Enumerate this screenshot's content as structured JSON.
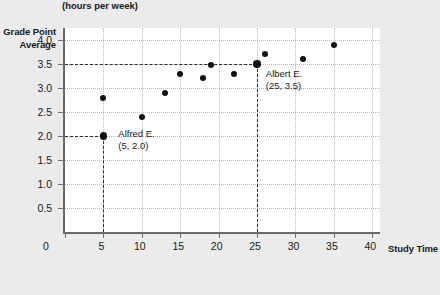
{
  "chart_data": {
    "type": "scatter",
    "title": "",
    "xlabel": "Study Time",
    "xlabel_unit": "(hours per week)",
    "ylabel": "Grade Point Average",
    "xlim": [
      0,
      41
    ],
    "ylim": [
      0,
      4.25
    ],
    "grid": true,
    "legend": "none",
    "x_ticks": [
      0,
      5,
      10,
      15,
      20,
      25,
      30,
      35,
      40
    ],
    "x_tick_labels": [
      "0",
      "5",
      "10",
      "15",
      "20",
      "25",
      "30",
      "35",
      "40"
    ],
    "y_ticks": [
      0.5,
      1.0,
      1.5,
      2.0,
      2.5,
      3.0,
      3.5,
      4.0
    ],
    "y_tick_labels": [
      "0.5",
      "1.0",
      "1.5",
      "2.0",
      "2.5",
      "3.0",
      "3.5",
      "4.0"
    ],
    "origin_label": "0",
    "points": [
      {
        "x": 5,
        "y": 2.0,
        "label": "Alfred E.",
        "highlight": true
      },
      {
        "x": 5,
        "y": 2.8,
        "label": "",
        "highlight": false
      },
      {
        "x": 10,
        "y": 2.4,
        "label": "",
        "highlight": false
      },
      {
        "x": 13,
        "y": 2.9,
        "label": "",
        "highlight": false
      },
      {
        "x": 15,
        "y": 3.3,
        "label": "",
        "highlight": false
      },
      {
        "x": 18,
        "y": 3.2,
        "label": "",
        "highlight": false
      },
      {
        "x": 19,
        "y": 3.48,
        "label": "",
        "highlight": false
      },
      {
        "x": 22,
        "y": 3.3,
        "label": "",
        "highlight": false
      },
      {
        "x": 25,
        "y": 3.5,
        "label": "Albert E.",
        "highlight": true
      },
      {
        "x": 26,
        "y": 3.7,
        "label": "",
        "highlight": false
      },
      {
        "x": 31,
        "y": 3.6,
        "label": "",
        "highlight": false
      },
      {
        "x": 35,
        "y": 3.9,
        "label": "",
        "highlight": false
      }
    ],
    "reference_lines": [
      {
        "axis": "y",
        "value": 2.0,
        "from_x": 0,
        "to_x": 5
      },
      {
        "axis": "x",
        "value": 5,
        "from_y": 0,
        "to_y": 2.0
      },
      {
        "axis": "y",
        "value": 3.5,
        "from_x": 0,
        "to_x": 25
      },
      {
        "axis": "x",
        "value": 25,
        "from_y": 0,
        "to_y": 3.5
      }
    ],
    "annotations": [
      {
        "name": "alfred",
        "name_text": "Alfred E.",
        "coord_text": "(5, 2.0)",
        "x": 7.2,
        "y": 2.05
      },
      {
        "name": "albert",
        "name_text": "Albert E.",
        "coord_text": "(25, 3.5)",
        "x": 26.4,
        "y": 3.3
      }
    ]
  },
  "colors": {
    "background": "#ebebeb",
    "plot_background": "#ffffff",
    "axis": "#666a6c",
    "gridline": "#b9b9b9",
    "point": "#111111",
    "reference_line": "#2b2b2b",
    "text": "#1a1a1a"
  }
}
